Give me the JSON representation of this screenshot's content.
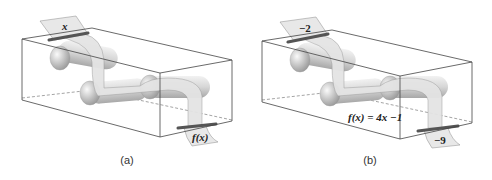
{
  "figure": {
    "panels": [
      {
        "id": "a",
        "caption": "(a)",
        "input_label": "x",
        "output_label": "f(x)",
        "rule_label": ""
      },
      {
        "id": "b",
        "caption": "(b)",
        "input_label": "−2",
        "output_label": "−9",
        "rule_label": "f(x) = 4x −1"
      }
    ],
    "colors": {
      "box_edge": "#444444",
      "paper": "#e6e6e6",
      "paper_edge": "#8a8a8a",
      "roller": "#cfcfcf",
      "slot": "#555555"
    }
  }
}
